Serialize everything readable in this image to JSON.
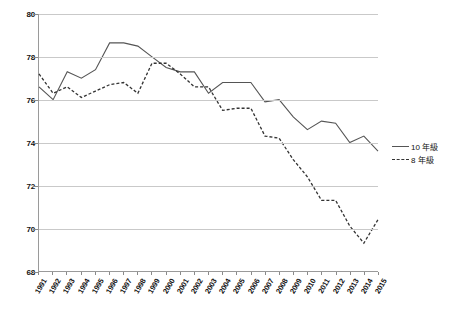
{
  "chart_data": {
    "type": "line",
    "title": "",
    "xlabel": "",
    "ylabel": "",
    "ylim": [
      68,
      80
    ],
    "yticks": [
      68,
      70,
      72,
      74,
      76,
      78,
      80
    ],
    "grid": true,
    "legend_position": "right",
    "categories": [
      "1991",
      "1992",
      "1993",
      "1994",
      "1995",
      "1996",
      "1997",
      "1998",
      "1999",
      "2000",
      "2001",
      "2002",
      "2003",
      "2004",
      "2005",
      "2006",
      "2007",
      "2008",
      "2009",
      "2010",
      "2011",
      "2012",
      "2013",
      "2014",
      "2015"
    ],
    "series": [
      {
        "name": "10 年級",
        "style": "solid",
        "color": "#555555",
        "values": [
          76.6,
          76.0,
          77.3,
          77.0,
          77.4,
          78.65,
          78.65,
          78.5,
          78.0,
          77.5,
          77.3,
          77.3,
          76.3,
          76.8,
          76.8,
          76.8,
          75.9,
          76.0,
          75.2,
          74.6,
          75.0,
          74.9,
          74.0,
          74.3,
          73.6
        ]
      },
      {
        "name": "8 年級",
        "style": "dashed",
        "color": "#333333",
        "values": [
          77.2,
          76.3,
          76.6,
          76.1,
          76.4,
          76.7,
          76.8,
          76.3,
          77.7,
          77.7,
          77.2,
          76.6,
          76.6,
          75.5,
          75.6,
          75.6,
          74.3,
          74.2,
          73.2,
          72.4,
          71.3,
          71.3,
          70.1,
          69.3,
          70.4
        ]
      }
    ]
  },
  "legend": {
    "items": [
      {
        "label": "10 年級",
        "style": "solid"
      },
      {
        "label": "8 年級",
        "style": "dashed"
      }
    ]
  }
}
